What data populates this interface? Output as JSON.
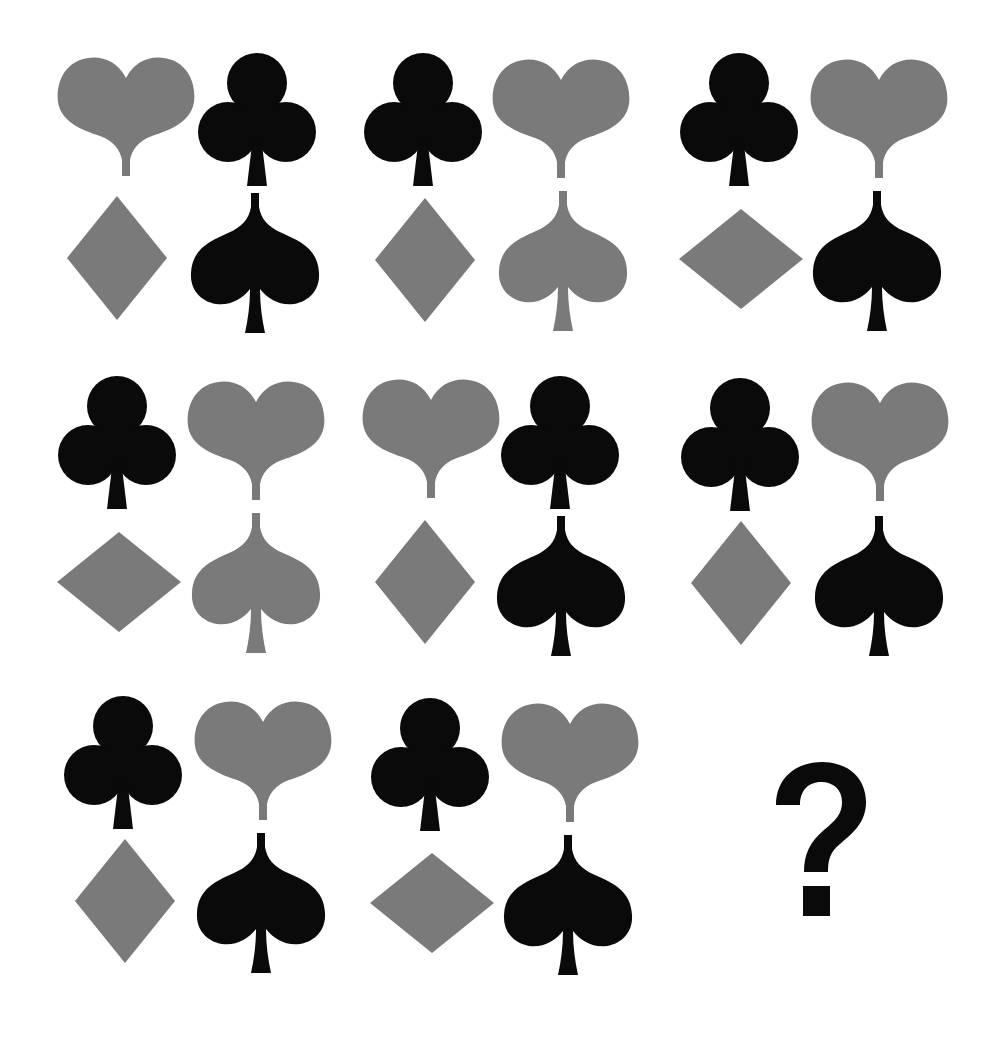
{
  "puzzle": {
    "title": "",
    "colors": {
      "gray": "#7a7a7a",
      "black": "#0a0a0a",
      "background": "#ffffff"
    },
    "answer_placeholder": "?",
    "cells": [
      {
        "row": 1,
        "col": 1,
        "top_left": {
          "shape": "heart",
          "color": "gray"
        },
        "top_right": {
          "shape": "club",
          "color": "black"
        },
        "bottom_left": {
          "shape": "diamond",
          "color": "gray",
          "orientation": "tall"
        },
        "bottom_right": {
          "shape": "spade",
          "color": "black"
        }
      },
      {
        "row": 1,
        "col": 2,
        "top_left": {
          "shape": "club",
          "color": "black"
        },
        "top_right": {
          "shape": "heart",
          "color": "gray"
        },
        "bottom_left": {
          "shape": "diamond",
          "color": "gray",
          "orientation": "tall"
        },
        "bottom_right": {
          "shape": "spade",
          "color": "gray"
        }
      },
      {
        "row": 1,
        "col": 3,
        "top_left": {
          "shape": "club",
          "color": "black"
        },
        "top_right": {
          "shape": "heart",
          "color": "gray"
        },
        "bottom_left": {
          "shape": "diamond",
          "color": "gray",
          "orientation": "wide"
        },
        "bottom_right": {
          "shape": "spade",
          "color": "black"
        }
      },
      {
        "row": 2,
        "col": 1,
        "top_left": {
          "shape": "club",
          "color": "black"
        },
        "top_right": {
          "shape": "heart",
          "color": "gray"
        },
        "bottom_left": {
          "shape": "diamond",
          "color": "gray",
          "orientation": "wide"
        },
        "bottom_right": {
          "shape": "spade",
          "color": "gray"
        }
      },
      {
        "row": 2,
        "col": 2,
        "top_left": {
          "shape": "heart",
          "color": "gray"
        },
        "top_right": {
          "shape": "club",
          "color": "black"
        },
        "bottom_left": {
          "shape": "diamond",
          "color": "gray",
          "orientation": "tall"
        },
        "bottom_right": {
          "shape": "spade",
          "color": "black"
        }
      },
      {
        "row": 2,
        "col": 3,
        "top_left": {
          "shape": "club",
          "color": "black"
        },
        "top_right": {
          "shape": "heart",
          "color": "gray"
        },
        "bottom_left": {
          "shape": "diamond",
          "color": "gray",
          "orientation": "tall"
        },
        "bottom_right": {
          "shape": "spade",
          "color": "black"
        }
      },
      {
        "row": 3,
        "col": 1,
        "top_left": {
          "shape": "club",
          "color": "black"
        },
        "top_right": {
          "shape": "heart",
          "color": "gray"
        },
        "bottom_left": {
          "shape": "diamond",
          "color": "gray",
          "orientation": "tall"
        },
        "bottom_right": {
          "shape": "spade",
          "color": "black"
        }
      },
      {
        "row": 3,
        "col": 2,
        "top_left": {
          "shape": "club",
          "color": "black"
        },
        "top_right": {
          "shape": "heart",
          "color": "gray"
        },
        "bottom_left": {
          "shape": "diamond",
          "color": "gray",
          "orientation": "wide"
        },
        "bottom_right": {
          "shape": "spade",
          "color": "black"
        }
      },
      {
        "row": 3,
        "col": 3,
        "missing": true,
        "label": "?"
      }
    ]
  }
}
